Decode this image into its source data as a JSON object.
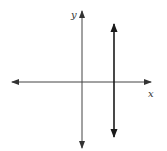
{
  "diagram": {
    "type": "coordinate-plane",
    "axes": {
      "x_label": "x",
      "y_label": "y",
      "color": "#444444"
    },
    "vertical_line": {
      "equation_form": "x = a (a > 0)",
      "color": "#222222"
    },
    "origin_px": [
      82,
      82
    ]
  }
}
